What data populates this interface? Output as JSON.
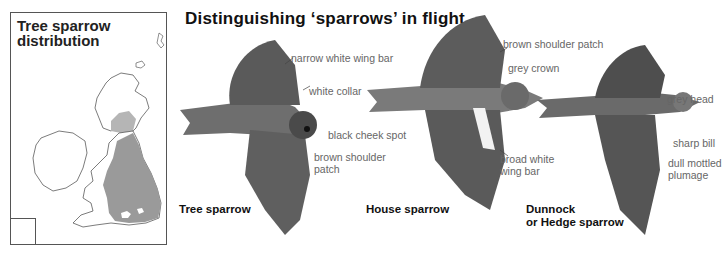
{
  "map": {
    "title_line1": "Tree sparrow",
    "title_line2": "distribution",
    "colors": {
      "distribution_fill": "#9a9a9a",
      "outline": "#444444"
    }
  },
  "main_title": "Distinguishing ‘sparrows’ in flight",
  "birds": [
    {
      "species": "Tree sparrow",
      "labels": [
        "narrow white wing bar",
        "white collar",
        "black cheek spot",
        "brown shoulder",
        "patch"
      ]
    },
    {
      "species": "House sparrow",
      "labels": [
        "brown shoulder patch",
        "grey crown",
        "broad white",
        "wing bar"
      ]
    },
    {
      "species_line1": "Dunnock",
      "species_line2": "or Hedge sparrow",
      "labels": [
        "grey head",
        "sharp bill",
        "dull mottled",
        "plumage"
      ]
    }
  ]
}
